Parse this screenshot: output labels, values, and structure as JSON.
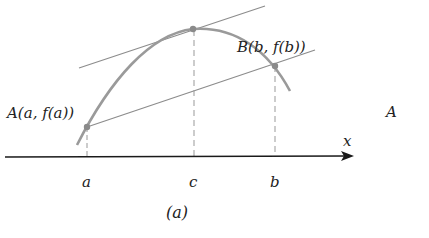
{
  "figure": {
    "caption": "(a)",
    "theorem": "Mean Value Theorem illustration",
    "colors": {
      "curve": "#9a9a9a",
      "lines": "#8c8c8c",
      "axis": "#1a1a1a",
      "points": "#8a8a8a",
      "text": "#222222"
    },
    "points": {
      "A": {
        "label": "A(a, f(a))"
      },
      "B": {
        "label": "B(b, f(b))"
      }
    },
    "axis": {
      "label": "x"
    },
    "ticks": [
      {
        "label": "a"
      },
      {
        "label": "c"
      },
      {
        "label": "b"
      }
    ],
    "cropped_right_label": "A"
  }
}
